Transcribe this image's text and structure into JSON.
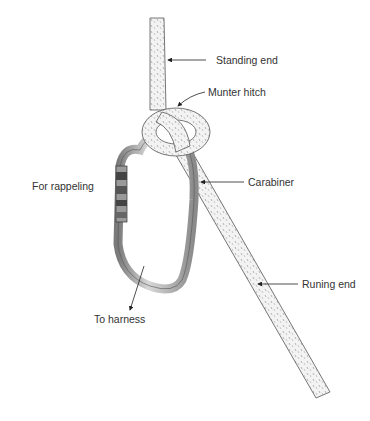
{
  "diagram": {
    "labels": {
      "standing_end": "Standing end",
      "munter_hitch": "Munter hitch",
      "carabiner": "Carabiner",
      "for_rappeling": "For rappeling",
      "running_end": "Runing end",
      "to_harness": "To harness"
    },
    "colors": {
      "rope_fill": "#f1f1f1",
      "rope_outline": "#555555",
      "carabiner_metal": "#a8a8a8",
      "label_text": "#333333",
      "arrow": "#222222"
    }
  }
}
